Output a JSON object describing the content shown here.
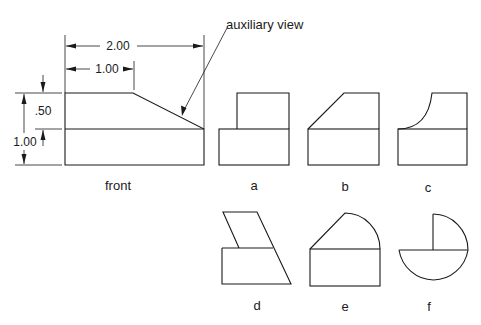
{
  "front_view": {
    "caption": "front",
    "dimensions": {
      "overall_width": "2.00",
      "top_width": "1.00",
      "upper_height": ".50",
      "overall_height": "1.00"
    },
    "leader_label": "auxiliary view"
  },
  "options": [
    {
      "label": "a",
      "shape": "rectangular block on base"
    },
    {
      "label": "b",
      "shape": "chamfered block on base"
    },
    {
      "label": "c",
      "shape": "concave curved block on base"
    },
    {
      "label": "d",
      "shape": "slanted parallelogram on trapezoid base"
    },
    {
      "label": "e",
      "shape": "chamfer with arc top on base"
    },
    {
      "label": "f",
      "shape": "quarter circle above half circle"
    }
  ]
}
